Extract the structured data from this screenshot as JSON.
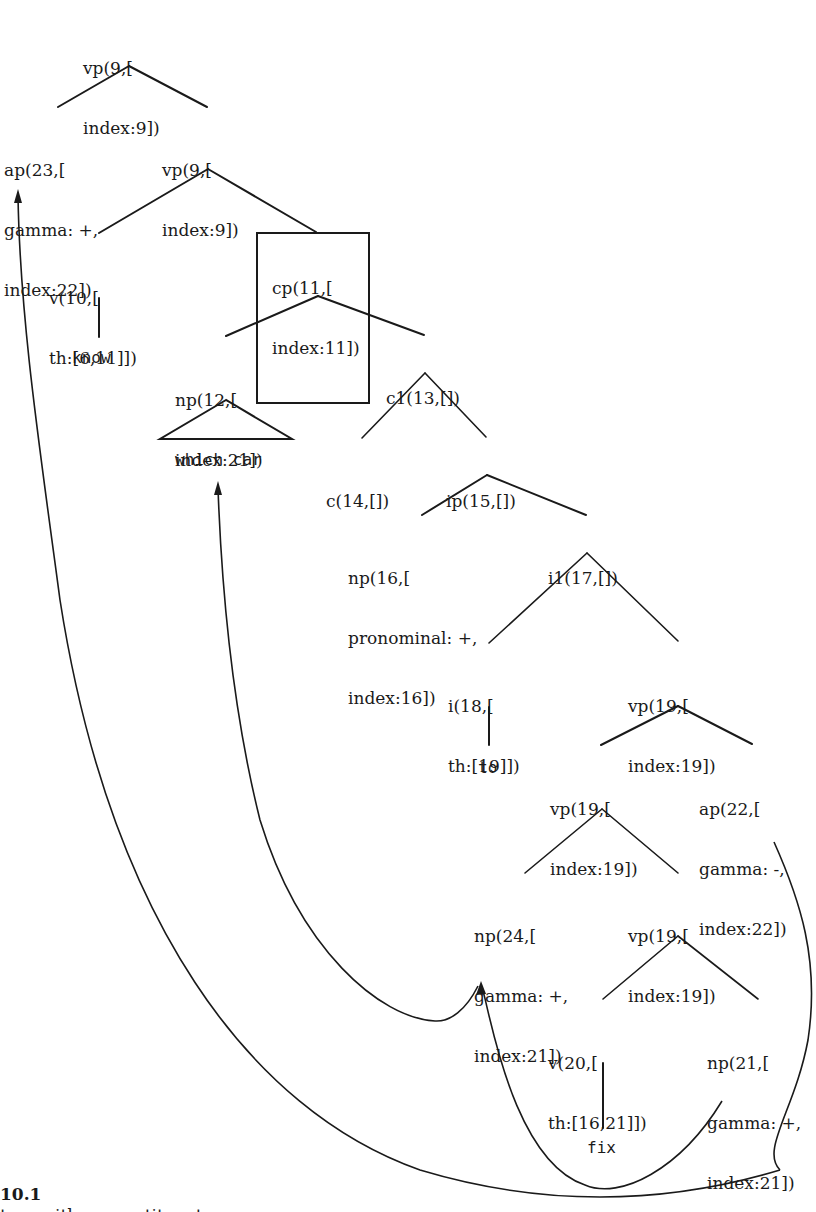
{
  "figure": {
    "number": "10.1",
    "caption_partial": "tree with ... constituent",
    "line_color": "#1a1a1a",
    "background": "#ffffff"
  },
  "nodes": {
    "vp9_root": {
      "lines": [
        "vp(9,[",
        "index:9])"
      ]
    },
    "ap23": {
      "lines": [
        "ap(23,[",
        "gamma: +,",
        "index:22])"
      ]
    },
    "vp9_b": {
      "lines": [
        "vp(9,[",
        "index:9])"
      ]
    },
    "v10": {
      "lines": [
        "v(10,[",
        "th:[6,11]])"
      ]
    },
    "cp11": {
      "lines": [
        "cp(11,[",
        "index:11])"
      ],
      "boxed": true
    },
    "np12": {
      "lines": [
        "np(12,[",
        "index:21])"
      ]
    },
    "c1_13": {
      "lines": [
        "c1(13,[])"
      ]
    },
    "c14": {
      "lines": [
        "c(14,[])"
      ]
    },
    "ip15": {
      "lines": [
        "ip(15,[])"
      ]
    },
    "np16": {
      "lines": [
        "np(16,[",
        "pronominal: +,",
        "index:16])"
      ]
    },
    "i1_17": {
      "lines": [
        "i1(17,[])"
      ]
    },
    "i18": {
      "lines": [
        "i(18,[",
        "th:[19]])"
      ]
    },
    "vp19_a": {
      "lines": [
        "vp(19,[",
        "index:19])"
      ]
    },
    "vp19_b": {
      "lines": [
        "vp(19,[",
        "index:19])"
      ]
    },
    "ap22": {
      "lines": [
        "ap(22,[",
        "gamma: -,",
        "index:22])"
      ]
    },
    "np24": {
      "lines": [
        "np(24,[",
        "gamma: +,",
        "index:21])"
      ]
    },
    "vp19_c": {
      "lines": [
        "vp(19,[",
        "index:19])"
      ]
    },
    "v20": {
      "lines": [
        "v(20,[",
        "th:[16,21]])"
      ]
    },
    "np21": {
      "lines": [
        "np(21,[",
        "gamma: +,",
        "index:21])"
      ]
    }
  },
  "leaves": {
    "know": "know",
    "which_car": "which car",
    "to": "to",
    "fix": "fix"
  }
}
